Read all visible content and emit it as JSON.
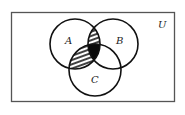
{
  "diagram": {
    "type": "venn",
    "universe_label": "U",
    "sets": [
      {
        "name": "A",
        "label": "A",
        "cx": 75,
        "cy": 44,
        "r": 25
      },
      {
        "name": "B",
        "label": "B",
        "cx": 113,
        "cy": 44,
        "r": 25
      },
      {
        "name": "C",
        "label": "C",
        "cx": 95,
        "cy": 70,
        "r": 26
      }
    ],
    "shaded_regions": [
      {
        "region": "A∩B (only)",
        "style": "hatched"
      },
      {
        "region": "A∩C (only)",
        "style": "hatched"
      },
      {
        "region": "A∩B∩C",
        "style": "solid"
      }
    ],
    "colors": {
      "stroke": "#111111",
      "frame": "#555555",
      "solid_fill": "#0a0a0a",
      "background": "#ffffff"
    }
  }
}
